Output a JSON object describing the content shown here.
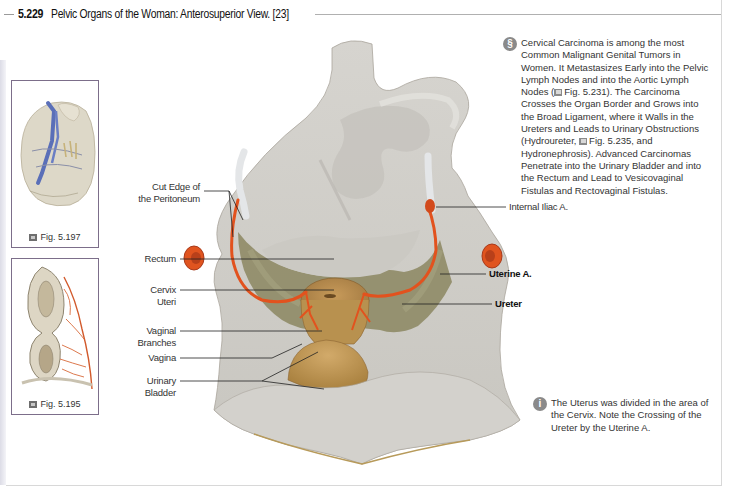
{
  "header": {
    "figure_number": "5.229",
    "title": "Pelvic Organs of the Woman: Anterosuperior View. [23]"
  },
  "thumbnails": [
    {
      "caption": "Fig. 5.197",
      "icon": "figure-reference-icon"
    },
    {
      "caption": "Fig. 5.195",
      "icon": "figure-reference-icon"
    }
  ],
  "labels_left": [
    {
      "id": "cut-edge",
      "text": "Cut Edge of the Peritoneum",
      "line1": "Cut Edge of",
      "line2": "the Peritoneum"
    },
    {
      "id": "rectum",
      "text": "Rectum",
      "line1": "Rectum"
    },
    {
      "id": "cervix-uteri",
      "text": "Cervix Uteri",
      "line1": "Cervix",
      "line2": "Uteri"
    },
    {
      "id": "vaginal-branches",
      "text": "Vaginal Branches",
      "line1": "Vaginal",
      "line2": "Branches"
    },
    {
      "id": "vagina",
      "text": "Vagina",
      "line1": "Vagina"
    },
    {
      "id": "urinary-bladder",
      "text": "Urinary Bladder",
      "line1": "Urinary",
      "line2": "Bladder"
    }
  ],
  "labels_right": [
    {
      "id": "internal-iliac",
      "text": "Internal Iliac A.",
      "bold": false
    },
    {
      "id": "uterine-a",
      "text": "Uterine A.",
      "bold": true
    },
    {
      "id": "ureter",
      "text": "Ureter",
      "bold": true
    }
  ],
  "notes": [
    {
      "icon": "clinical-note-icon",
      "icon_glyph": "§",
      "parts": [
        "Cervical Carcinoma is among the most Common Malignant Genital Tumors in Women. It Metastasizes Early into the Pelvic Lymph Nodes and into the Aortic Lymph Nodes (",
        "Fig. 5.231). The Carcinoma Crosses the Organ Border and Grows into the Broad Ligament, where it Walls in the Ureters and Leads to Urinary Obstructions (Hydroureter, ",
        "Fig. 5.235, and Hydronephrosis). Advanced Carcinomas Penetrate into the Urinary Bladder and into the Rectum and Lead to Vesicovaginal Fistulas and Rectovaginal Fistulas."
      ]
    },
    {
      "icon": "info-icon",
      "icon_glyph": "i",
      "text": "The Uterus was divided in the area of the Cervix. Note the Crossing of the Ureter by the Uterine A."
    }
  ],
  "colors": {
    "peritoneum": "#cfcdc8",
    "artery": "#e2521e",
    "fossa": "#8e8a62",
    "uterus": "#b98c4e",
    "thumb_border": "#7c6e8a"
  }
}
